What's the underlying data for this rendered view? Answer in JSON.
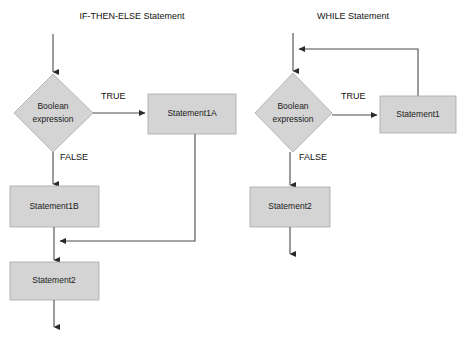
{
  "page": {
    "background_color": "#ffffff",
    "shape_fill_color": "#d4d4d4",
    "shape_border_color": "#a9a9a9",
    "connector_color": "#4a4a4a"
  },
  "diagrams": [
    {
      "id": "if-then-else",
      "title": "IF-THEN-ELSE Statement",
      "nodes": {
        "decision": "Boolean\nexpression",
        "decision_line1": "Boolean",
        "decision_line2": "expression",
        "true_branch": "Statement1A",
        "false_branch": "Statement1B",
        "merge": "Statement2"
      },
      "edge_labels": {
        "true": "TRUE",
        "false": "FALSE"
      }
    },
    {
      "id": "while",
      "title": "WHILE Statement",
      "nodes": {
        "decision_line1": "Boolean",
        "decision_line2": "expression",
        "true_branch": "Statement1",
        "exit": "Statement2"
      },
      "edge_labels": {
        "true": "TRUE",
        "false": "FALSE"
      }
    }
  ]
}
